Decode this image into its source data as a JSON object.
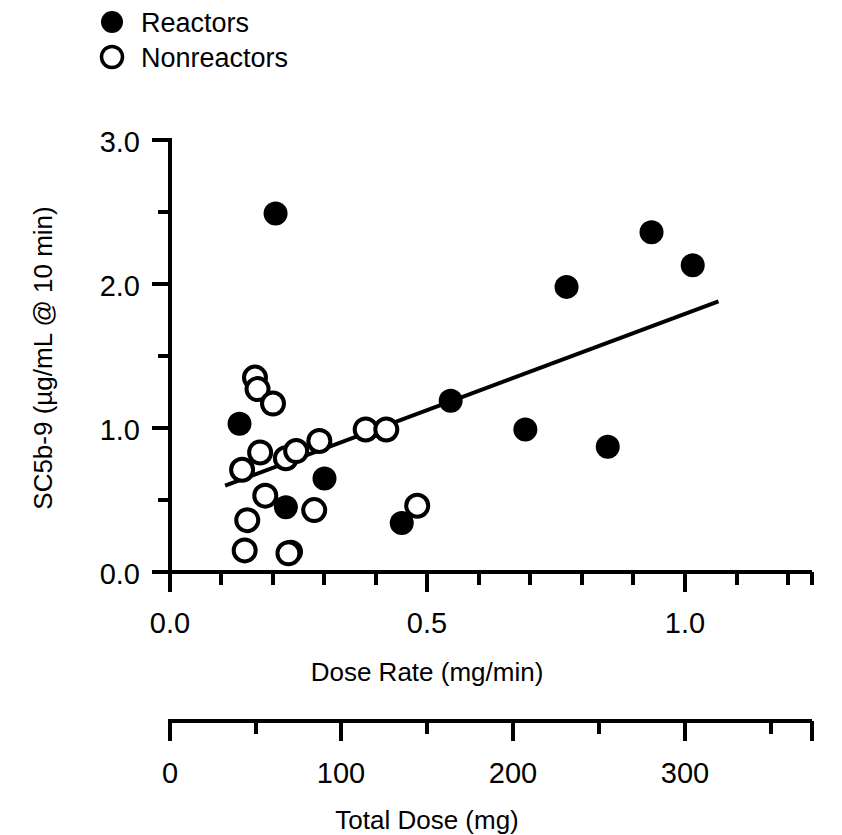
{
  "chart_data": {
    "type": "scatter",
    "title": "",
    "xlabel": "Dose Rate (mg/min)",
    "ylabel": "SC5b-9 (µg/mL @ 10 min)",
    "secondary_xlabel": "Total Dose (mg)",
    "xlim": [
      0.0,
      1.25
    ],
    "ylim": [
      0.0,
      3.0
    ],
    "secondary_xlim": [
      0,
      375
    ],
    "grid": false,
    "legend_position": "top-left",
    "xticks": [
      0.0,
      0.5,
      1.0
    ],
    "xtick_labels": [
      "0.0",
      "0.5",
      "1.0"
    ],
    "xminor_step": 0.1,
    "yticks": [
      0.0,
      1.0,
      2.0,
      3.0
    ],
    "ytick_labels": [
      "0.0",
      "1.0",
      "2.0",
      "3.0"
    ],
    "yminor_step": 0.5,
    "secondary_xticks": [
      0,
      100,
      200,
      300
    ],
    "secondary_xtick_labels": [
      "0",
      "100",
      "200",
      "300"
    ],
    "secondary_xminor_step": 50,
    "legend": [
      {
        "name": "Reactors",
        "marker": "filled-circle"
      },
      {
        "name": "Nonreactors",
        "marker": "open-circle"
      }
    ],
    "series": [
      {
        "name": "Reactors",
        "marker": "filled-circle",
        "color": "#000000",
        "points": [
          [
            0.135,
            1.03
          ],
          [
            0.205,
            2.49
          ],
          [
            0.225,
            0.45
          ],
          [
            0.235,
            0.14
          ],
          [
            0.3,
            0.65
          ],
          [
            0.45,
            0.34
          ],
          [
            0.545,
            1.19
          ],
          [
            0.69,
            0.99
          ],
          [
            0.77,
            1.98
          ],
          [
            0.85,
            0.87
          ],
          [
            0.935,
            2.36
          ],
          [
            1.015,
            2.13
          ]
        ]
      },
      {
        "name": "Nonreactors",
        "marker": "open-circle",
        "color": "#000000",
        "points": [
          [
            0.14,
            0.71
          ],
          [
            0.145,
            0.15
          ],
          [
            0.15,
            0.36
          ],
          [
            0.165,
            1.35
          ],
          [
            0.17,
            1.27
          ],
          [
            0.175,
            0.83
          ],
          [
            0.185,
            0.53
          ],
          [
            0.2,
            1.17
          ],
          [
            0.225,
            0.79
          ],
          [
            0.23,
            0.13
          ],
          [
            0.245,
            0.84
          ],
          [
            0.28,
            0.43
          ],
          [
            0.29,
            0.91
          ],
          [
            0.38,
            0.99
          ],
          [
            0.42,
            0.99
          ],
          [
            0.48,
            0.46
          ]
        ]
      }
    ],
    "trendline": {
      "name": "regression-line",
      "x_start": 0.107,
      "y_start": 0.6,
      "x_end": 1.065,
      "y_end": 1.88
    }
  }
}
